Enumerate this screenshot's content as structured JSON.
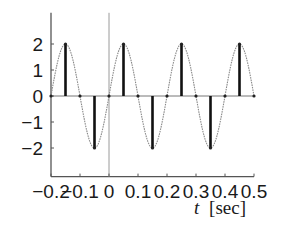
{
  "chart_data": {
    "type": "line",
    "title": "",
    "xlabel": "t [sec]",
    "xlabel_var": "t",
    "xlabel_unit": "[sec]",
    "ylabel": "",
    "xlim": [
      -0.2,
      0.5
    ],
    "ylim": [
      -3.1,
      3.2
    ],
    "grid": false,
    "legend": null,
    "x_ticks": [
      -0.2,
      -0.1,
      0,
      0.1,
      0.2,
      0.3,
      0.4,
      0.5
    ],
    "x_tick_labels": [
      "−0.2",
      "−0.1",
      "0",
      "0.1",
      "0.2",
      "0.3",
      "0.4",
      "0.5"
    ],
    "y_ticks": [
      2,
      1,
      0,
      -1,
      -2
    ],
    "y_tick_labels": [
      "2",
      "1",
      "0",
      "−1",
      "−2"
    ],
    "series": [
      {
        "name": "continuous signal",
        "style": "thin gray dotted curve",
        "formula": "2*sin(2*pi*5*t)",
        "amplitude": 2,
        "frequency_hz": 5,
        "x_range": [
          -0.2,
          0.5
        ]
      },
      {
        "name": "samples",
        "style": "thick black stems",
        "x": [
          -0.2,
          -0.15,
          -0.1,
          -0.05,
          0,
          0.05,
          0.1,
          0.15,
          0.2,
          0.25,
          0.3,
          0.35,
          0.4,
          0.45,
          0.5
        ],
        "values": [
          0,
          2,
          0,
          -2,
          0,
          2,
          0,
          -2,
          0,
          2,
          0,
          -2,
          0,
          2,
          0
        ]
      }
    ],
    "annotations": [
      "vertical reference line at t = 0",
      "horizontal zero line"
    ],
    "colors": {
      "curve": "#8a8a8a",
      "stems": "#111111",
      "axes": "#555555",
      "ref_line": "#9a9a9a"
    }
  }
}
